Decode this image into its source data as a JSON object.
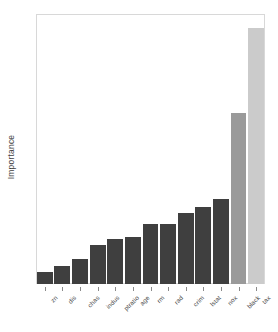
{
  "chart_data": {
    "type": "bar",
    "title": "",
    "subtitle": "",
    "xlabel": "",
    "ylabel": "Importance",
    "ylim": [
      0,
      0.265
    ],
    "yticks": [
      0.0,
      0.1,
      0.2
    ],
    "ytick_labels": [
      "0.0",
      "0.1",
      "0.2"
    ],
    "grid": false,
    "legend": null,
    "orientation": "vertical",
    "sorted": "ascending",
    "categories": [
      "zn",
      "dis",
      "chas",
      "indus",
      "ptratio",
      "age",
      "rm",
      "rad",
      "crim",
      "lstat",
      "nox",
      "black",
      "tax"
    ],
    "values": [
      0.012,
      0.018,
      0.026,
      0.04,
      0.046,
      0.048,
      0.061,
      0.061,
      0.072,
      0.079,
      0.087,
      0.175,
      0.261
    ],
    "bar_colors": [
      "#3f3f3f",
      "#3f3f3f",
      "#3f3f3f",
      "#3f3f3f",
      "#3f3f3f",
      "#3f3f3f",
      "#3f3f3f",
      "#3f3f3f",
      "#3f3f3f",
      "#3f3f3f",
      "#3f3f3f",
      "#9a9a9a",
      "#cbcbcb"
    ],
    "colors": {
      "bar_dark": "#3f3f3f",
      "bar_medium": "#9a9a9a",
      "bar_light": "#cbcbcb",
      "frame": "#d8d8d8",
      "axis_text": "#4a4a4a",
      "background": "#ffffff"
    }
  }
}
